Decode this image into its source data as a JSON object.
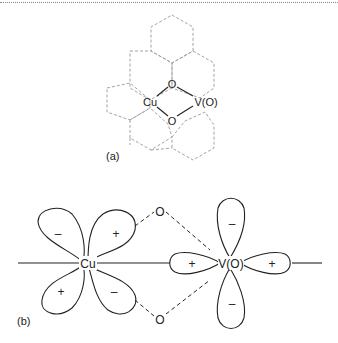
{
  "panel_a": {
    "label": "(a)",
    "atoms": {
      "cu": "Cu",
      "v": "V(O)",
      "o_top": "O",
      "o_bottom": "O"
    }
  },
  "panel_b": {
    "label": "(b)",
    "atoms": {
      "cu": "Cu",
      "v": "V(O)",
      "o_top": "O",
      "o_bottom": "O"
    },
    "cu_lobe_signs": {
      "upper_left": "–",
      "upper_right": "+",
      "lower_left": "+",
      "lower_right": "–"
    },
    "v_lobe_signs": {
      "top": "–",
      "left": "+",
      "right": "+",
      "bottom": "–"
    }
  }
}
